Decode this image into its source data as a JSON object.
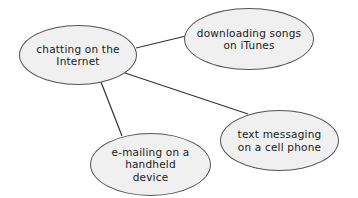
{
  "diagram": {
    "type": "concept-map",
    "colors": {
      "node_fill": "#f0f0f0",
      "node_border": "#555555",
      "line": "#333333",
      "text": "#1a1a1a",
      "background": "#ffffff"
    },
    "center_node": {
      "id": "chatting",
      "label": "chatting on the\nInternet"
    },
    "nodes": [
      {
        "id": "itunes",
        "label": "downloading songs\non iTunes"
      },
      {
        "id": "texting",
        "label": "text messaging\non a cell phone"
      },
      {
        "id": "email",
        "label": "e-mailing on a\nhandheld\ndevice"
      }
    ],
    "edges": [
      {
        "from": "chatting",
        "to": "itunes"
      },
      {
        "from": "chatting",
        "to": "texting"
      },
      {
        "from": "chatting",
        "to": "email"
      }
    ]
  }
}
